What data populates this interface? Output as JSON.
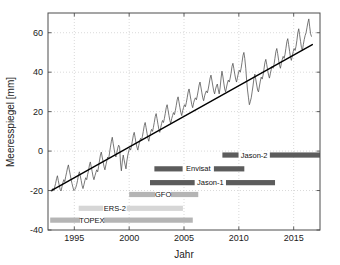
{
  "figure": {
    "background": "#ffffff",
    "frame_color": "#4d4d4d"
  },
  "chart_data": {
    "type": "line",
    "title": "",
    "xlabel": "Jahr",
    "ylabel": "Meeresspiegel [mm]",
    "xlim": [
      1992.6,
      1992.6
    ],
    "xlim_values": [
      1992.6,
      2017.4
    ],
    "ylim": [
      -40,
      70
    ],
    "grid": true,
    "grid_style": "dotted",
    "xticks": [
      1995,
      2000,
      2005,
      2010,
      2015
    ],
    "xtick_labels": [
      "1995",
      "2000",
      "2005",
      "2010",
      "2015"
    ],
    "yticks": [
      -40,
      -20,
      0,
      20,
      40,
      60
    ],
    "ytick_labels": [
      "-40",
      "-20",
      "0",
      "20",
      "40",
      "60"
    ],
    "legend": "none",
    "series": [
      {
        "name": "Meeresspiegel (Monatswerte)",
        "color": "#555555",
        "width": 0.8,
        "x": [
          1992.96,
          1993.04,
          1993.13,
          1993.21,
          1993.29,
          1993.38,
          1993.46,
          1993.54,
          1993.63,
          1993.71,
          1993.79,
          1993.88,
          1993.96,
          1994.04,
          1994.13,
          1994.21,
          1994.29,
          1994.38,
          1994.46,
          1994.54,
          1994.63,
          1994.71,
          1994.79,
          1994.88,
          1994.96,
          1995.04,
          1995.13,
          1995.21,
          1995.29,
          1995.38,
          1995.46,
          1995.54,
          1995.63,
          1995.71,
          1995.79,
          1995.88,
          1995.96,
          1996.04,
          1996.13,
          1996.21,
          1996.29,
          1996.38,
          1996.46,
          1996.54,
          1996.63,
          1996.71,
          1996.79,
          1996.88,
          1996.96,
          1997.04,
          1997.13,
          1997.21,
          1997.29,
          1997.38,
          1997.46,
          1997.54,
          1997.63,
          1997.71,
          1997.79,
          1997.88,
          1997.96,
          1998.04,
          1998.13,
          1998.21,
          1998.29,
          1998.38,
          1998.46,
          1998.54,
          1998.63,
          1998.71,
          1998.79,
          1998.88,
          1998.96,
          1999.04,
          1999.13,
          1999.21,
          1999.29,
          1999.38,
          1999.46,
          1999.54,
          1999.63,
          1999.71,
          1999.79,
          1999.88,
          1999.96,
          2000.04,
          2000.13,
          2000.21,
          2000.29,
          2000.38,
          2000.46,
          2000.54,
          2000.63,
          2000.71,
          2000.79,
          2000.88,
          2000.96,
          2001.04,
          2001.13,
          2001.21,
          2001.29,
          2001.38,
          2001.46,
          2001.54,
          2001.63,
          2001.71,
          2001.79,
          2001.88,
          2001.96,
          2002.04,
          2002.13,
          2002.21,
          2002.29,
          2002.38,
          2002.46,
          2002.54,
          2002.63,
          2002.71,
          2002.79,
          2002.88,
          2002.96,
          2003.04,
          2003.13,
          2003.21,
          2003.29,
          2003.38,
          2003.46,
          2003.54,
          2003.63,
          2003.71,
          2003.79,
          2003.88,
          2003.96,
          2004.04,
          2004.13,
          2004.21,
          2004.29,
          2004.38,
          2004.46,
          2004.54,
          2004.63,
          2004.71,
          2004.79,
          2004.88,
          2004.96,
          2005.04,
          2005.13,
          2005.21,
          2005.29,
          2005.38,
          2005.46,
          2005.54,
          2005.63,
          2005.71,
          2005.79,
          2005.88,
          2005.96,
          2006.04,
          2006.13,
          2006.21,
          2006.29,
          2006.38,
          2006.46,
          2006.54,
          2006.63,
          2006.71,
          2006.79,
          2006.88,
          2006.96,
          2007.04,
          2007.13,
          2007.21,
          2007.29,
          2007.38,
          2007.46,
          2007.54,
          2007.63,
          2007.71,
          2007.79,
          2007.88,
          2007.96,
          2008.04,
          2008.13,
          2008.21,
          2008.29,
          2008.38,
          2008.46,
          2008.54,
          2008.63,
          2008.71,
          2008.79,
          2008.88,
          2008.96,
          2009.04,
          2009.13,
          2009.21,
          2009.29,
          2009.38,
          2009.46,
          2009.54,
          2009.63,
          2009.71,
          2009.79,
          2009.88,
          2009.96,
          2010.04,
          2010.13,
          2010.21,
          2010.29,
          2010.38,
          2010.46,
          2010.54,
          2010.63,
          2010.71,
          2010.79,
          2010.88,
          2010.96,
          2011.04,
          2011.13,
          2011.21,
          2011.29,
          2011.38,
          2011.46,
          2011.54,
          2011.63,
          2011.71,
          2011.79,
          2011.88,
          2011.96,
          2012.04,
          2012.13,
          2012.21,
          2012.29,
          2012.38,
          2012.46,
          2012.54,
          2012.63,
          2012.71,
          2012.79,
          2012.88,
          2012.96,
          2013.04,
          2013.13,
          2013.21,
          2013.29,
          2013.38,
          2013.46,
          2013.54,
          2013.63,
          2013.71,
          2013.79,
          2013.88,
          2013.96,
          2014.04,
          2014.13,
          2014.21,
          2014.29,
          2014.38,
          2014.46,
          2014.54,
          2014.63,
          2014.71,
          2014.79,
          2014.88,
          2014.96,
          2015.04,
          2015.13,
          2015.21,
          2015.29,
          2015.38,
          2015.46,
          2015.54,
          2015.63,
          2015.71,
          2015.79,
          2015.88,
          2015.96,
          2016.04,
          2016.13,
          2016.21,
          2016.29,
          2016.38,
          2016.46,
          2016.54,
          2016.63
        ],
        "y": [
          -20.5,
          -19.0,
          -20.0,
          -18.2,
          -16.5,
          -14.0,
          -12.5,
          -15.0,
          -17.5,
          -19.5,
          -20.2,
          -18.0,
          -16.0,
          -14.5,
          -15.5,
          -13.0,
          -11.0,
          -8.5,
          -7.0,
          -9.5,
          -12.0,
          -14.5,
          -16.5,
          -18.5,
          -20.0,
          -19.5,
          -18.5,
          -17.0,
          -15.0,
          -12.0,
          -10.5,
          -12.5,
          -15.0,
          -17.5,
          -19.0,
          -17.0,
          -15.0,
          -13.5,
          -14.5,
          -12.0,
          -10.0,
          -7.0,
          -5.5,
          -8.0,
          -10.5,
          -13.0,
          -14.5,
          -12.5,
          -11.0,
          -9.5,
          -10.5,
          -8.0,
          -5.0,
          -2.0,
          -0.5,
          -3.0,
          -5.5,
          -8.0,
          -9.5,
          -7.0,
          -5.0,
          -3.0,
          -4.0,
          -1.0,
          2.0,
          5.0,
          7.0,
          4.0,
          1.0,
          -1.5,
          -3.0,
          -0.5,
          1.5,
          3.0,
          2.0,
          -6.0,
          -10.0,
          -5.0,
          -2.0,
          -4.5,
          -7.0,
          -9.0,
          -5.0,
          -2.0,
          0.0,
          1.5,
          0.5,
          2.5,
          5.0,
          8.0,
          9.5,
          7.0,
          4.0,
          2.0,
          0.5,
          3.0,
          5.0,
          6.5,
          5.5,
          7.5,
          10.0,
          13.0,
          14.5,
          12.0,
          9.0,
          6.5,
          5.0,
          7.5,
          9.5,
          11.0,
          10.0,
          12.0,
          14.5,
          17.5,
          19.0,
          16.5,
          13.5,
          11.0,
          9.5,
          12.0,
          14.0,
          15.5,
          14.5,
          16.5,
          19.0,
          22.0,
          23.5,
          21.0,
          18.0,
          15.5,
          14.0,
          16.5,
          18.0,
          19.5,
          18.5,
          20.5,
          23.0,
          26.0,
          27.5,
          25.0,
          22.0,
          19.5,
          18.0,
          20.5,
          22.0,
          23.5,
          22.5,
          24.5,
          27.0,
          30.0,
          31.5,
          29.0,
          26.0,
          23.5,
          22.0,
          24.5,
          26.0,
          27.0,
          26.0,
          28.0,
          30.5,
          33.5,
          35.0,
          32.5,
          29.5,
          27.0,
          25.5,
          28.0,
          29.5,
          30.5,
          29.5,
          31.5,
          34.0,
          37.0,
          38.5,
          36.0,
          33.0,
          30.5,
          29.0,
          31.5,
          33.0,
          34.0,
          31.0,
          29.0,
          32.0,
          37.0,
          40.5,
          38.0,
          34.5,
          31.5,
          30.0,
          32.5,
          34.5,
          36.0,
          35.0,
          37.0,
          39.5,
          43.0,
          44.5,
          42.0,
          39.0,
          36.5,
          35.0,
          37.5,
          39.5,
          41.0,
          40.0,
          42.0,
          45.0,
          48.5,
          50.0,
          47.0,
          42.0,
          36.0,
          31.0,
          27.0,
          23.5,
          25.0,
          27.0,
          30.0,
          33.0,
          37.0,
          39.0,
          36.5,
          33.5,
          31.0,
          30.0,
          33.0,
          35.5,
          37.5,
          36.5,
          38.5,
          41.5,
          45.0,
          46.5,
          44.0,
          41.0,
          38.5,
          37.0,
          39.5,
          41.5,
          43.0,
          42.0,
          44.0,
          47.0,
          50.5,
          52.0,
          49.5,
          46.0,
          43.5,
          42.0,
          44.5,
          46.5,
          48.0,
          47.0,
          49.0,
          52.0,
          55.5,
          57.0,
          54.0,
          50.5,
          47.5,
          46.0,
          48.5,
          50.5,
          52.0,
          51.0,
          53.0,
          56.0,
          60.0,
          62.0,
          59.0,
          55.5,
          52.5,
          51.0,
          54.0,
          56.5,
          58.5,
          60.0,
          62.5,
          65.0,
          67.0,
          63.0,
          59.5,
          58.0
        ]
      }
    ],
    "trend": {
      "name": "Linearer Trend",
      "color": "#000000",
      "width": 1.4,
      "x": [
        1992.9,
        2016.7
      ],
      "y": [
        -20.0,
        54.0
      ]
    },
    "mission_bars": [
      {
        "label": "Jason-2",
        "start": 2008.5,
        "end": 2017.4,
        "level": -2,
        "color": "#5c5c5c",
        "label_x": 2011.4
      },
      {
        "label": "Envisat",
        "start": 2002.3,
        "end": 2010.5,
        "level": -9,
        "color": "#5c5c5c",
        "label_x": 2006.3
      },
      {
        "label": "Jason-1",
        "start": 2001.9,
        "end": 2013.3,
        "level": -16,
        "color": "#5c5c5c",
        "label_x": 2007.4
      },
      {
        "label": "GFO",
        "start": 2000.0,
        "end": 2006.3,
        "level": -22,
        "color": "#b5b5b5",
        "label_x": 2003.1
      },
      {
        "label": "ERS-2",
        "start": 1995.4,
        "end": 2004.9,
        "level": -29,
        "color": "#d6d6d6",
        "label_x": 1998.7
      },
      {
        "label": "TOPEX",
        "start": 1992.8,
        "end": 2005.8,
        "level": -35,
        "color": "#b5b5b5",
        "label_x": 1996.6
      }
    ]
  }
}
